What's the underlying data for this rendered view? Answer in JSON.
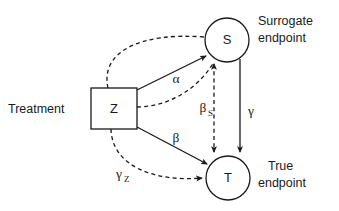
{
  "diagram": {
    "background_color": "#ffffff",
    "line_color": "#1a1a1a",
    "nodes": [
      {
        "id": "Z",
        "label": "Z",
        "shape": "square",
        "side_label_line1": "Treatment",
        "side_label_line2": "",
        "side_label_position": "left"
      },
      {
        "id": "S",
        "label": "S",
        "shape": "circle",
        "side_label_line1": "Surrogate",
        "side_label_line2": "endpoint",
        "side_label_position": "right"
      },
      {
        "id": "T",
        "label": "T",
        "shape": "circle",
        "side_label_line1": "True",
        "side_label_line2": "endpoint",
        "side_label_position": "right"
      }
    ],
    "edges": [
      {
        "id": "z-to-s-alpha",
        "from": "Z",
        "to": "S",
        "style": "solid",
        "arrow": "single",
        "label": "α",
        "label_sub": ""
      },
      {
        "id": "z-to-t-beta",
        "from": "Z",
        "to": "T",
        "style": "solid",
        "arrow": "single",
        "label": "β",
        "label_sub": ""
      },
      {
        "id": "s-to-t-gamma",
        "from": "S",
        "to": "T",
        "style": "solid",
        "arrow": "single",
        "label": "γ",
        "label_sub": ""
      },
      {
        "id": "s-t-beta-s",
        "from": "S",
        "to": "T",
        "style": "dashed",
        "arrow": "double",
        "label": "β",
        "label_sub": "S"
      },
      {
        "id": "z-to-t-gamma-z",
        "from": "Z",
        "to": "T",
        "style": "dashed",
        "arrow": "single",
        "label": "γ",
        "label_sub": "Z"
      },
      {
        "id": "z-upper-dashed-to-s",
        "from": "Z",
        "to": "S",
        "style": "dashed",
        "arrow": "none",
        "label": "",
        "label_sub": ""
      },
      {
        "id": "z-mid-dashed-to-s",
        "from": "Z",
        "to": "S",
        "style": "dashed",
        "arrow": "none",
        "label": "",
        "label_sub": ""
      }
    ]
  }
}
